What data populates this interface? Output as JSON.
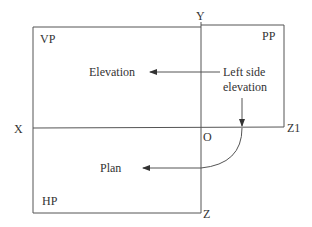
{
  "diagram": {
    "type": "orthographic-projection-planes",
    "planes": {
      "vertical": "VP",
      "profile": "PP",
      "horizontal": "HP"
    },
    "axes": {
      "x_label": "X",
      "y_label": "Y",
      "z_label": "Z",
      "z1_label": "Z1",
      "origin_label": "O"
    },
    "views": {
      "front": "Elevation",
      "side_line1": "Left side",
      "side_line2": "elevation",
      "top": "Plan"
    },
    "colors": {
      "line": "#555555",
      "text": "#333333",
      "background": "#ffffff"
    }
  }
}
